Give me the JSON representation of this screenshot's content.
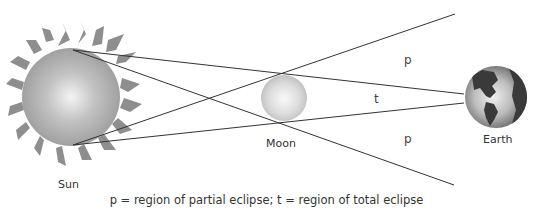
{
  "diagram": {
    "type": "solar-eclipse-geometry",
    "bodies": {
      "sun": {
        "label": "Sun",
        "cx": 71,
        "cy": 97,
        "r": 49
      },
      "moon": {
        "label": "Moon",
        "cx": 284,
        "cy": 98,
        "r": 23
      },
      "earth": {
        "label": "Earth",
        "cx": 496,
        "cy": 97,
        "r": 31
      }
    },
    "regions": {
      "partial_top": "p",
      "total": "t",
      "partial_bottom": "p"
    },
    "caption": "p = region of partial eclipse; t = region of total eclipse",
    "colors": {
      "line": "#333333",
      "sun_fill": "#b0b0b0",
      "sun_rays": "#8c8c8c",
      "moon_fill": "#d4d4d4",
      "earth_land": "#3a3a3a",
      "earth_ocean": "#c8c8c8"
    }
  }
}
